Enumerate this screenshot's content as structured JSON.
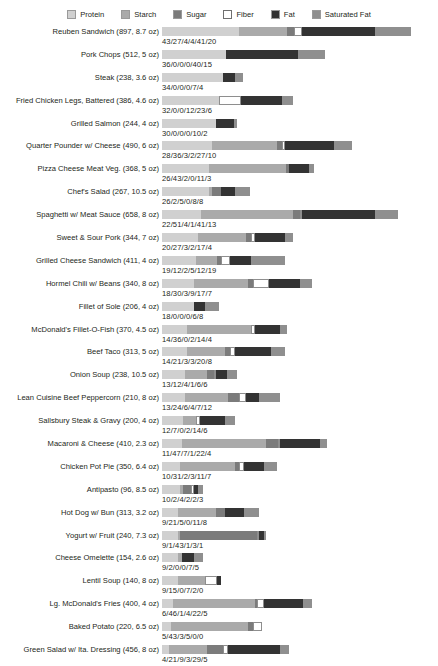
{
  "chart_data": {
    "type": "bar",
    "subtype": "stacked-horizontal",
    "title": "",
    "xlabel": "",
    "ylabel": "",
    "grid": false,
    "legend_position": "top-center",
    "value_label_format": "protein/starch/sugar/fiber/fat/saturated-fat (grams)",
    "px_per_unit": 1.79,
    "series": [
      {
        "name": "Protein",
        "color": "#d0d0d0"
      },
      {
        "name": "Starch",
        "color": "#aaaaaa"
      },
      {
        "name": "Sugar",
        "color": "#7b7b7b"
      },
      {
        "name": "Fiber",
        "color": "#ffffff"
      },
      {
        "name": "Fat",
        "color": "#333333"
      },
      {
        "name": "Saturated Fat",
        "color": "#8f8f8f"
      }
    ],
    "categories": [
      "Reuben Sandwich (897, 8.7 oz)",
      "Pork Chops (512, 5 oz)",
      "Steak (238, 3.6 oz)",
      "Fried Chicken Legs, Battered (386, 4.6 oz)",
      "Grilled Salmon (244, 4 oz)",
      "Quarter Pounder w/ Cheese (490, 6 oz)",
      "Pizza Cheese Meat Veg. (368, 5 oz)",
      "Chef's Salad (267, 10.5 oz)",
      "Spaghetti w/ Meat Sauce (658, 8 oz)",
      "Sweet & Sour Pork (344, 7 oz)",
      "Grilled Cheese Sandwich (411, 4 oz)",
      "Hormel Chili w/ Beans (340, 8 oz)",
      "Fillet of Sole (206, 4 oz)",
      "McDonald's Fillet-O-Fish (370, 4.5 oz)",
      "Beef Taco (313, 5 oz)",
      "Onion Soup (238, 10.5 oz)",
      "Lean Cuisine Beef Peppercorn (210, 8 oz)",
      "Sallsbury Steak & Gravy (200, 4 oz)",
      "Macaroni & Cheese (410, 2.3 oz)",
      "Chicken Pot Pie (350, 6.4 oz)",
      "Antipasto (96, 8.5 oz)",
      "Hot Dog w/ Bun (313, 3.2 oz)",
      "Yogurt w/ Fruit (240, 7.3 oz)",
      "Cheese Omelette (154, 2.6 oz)",
      "Lentil Soup (140, 8 oz)",
      "Lg. McDonald's Fries (400, 4 oz)",
      "Baked Potato (220, 6.5 oz)",
      "Green Salad w/ Ita. Dressing (456, 8 oz)"
    ],
    "rows": [
      {
        "label": "Reuben Sandwich (897, 8.7 oz)",
        "values": [
          43,
          27,
          4,
          4,
          41,
          20
        ],
        "value_label": "43/27/4/4/41/20"
      },
      {
        "label": "Pork Chops (512, 5 oz)",
        "values": [
          36,
          0,
          0,
          0,
          40,
          15
        ],
        "value_label": "36/0/0/0/40/15"
      },
      {
        "label": "Steak (238, 3.6 oz)",
        "values": [
          34,
          0,
          0,
          0,
          7,
          4
        ],
        "value_label": "34/0/0/0/7/4"
      },
      {
        "label": "Fried Chicken Legs, Battered (386, 4.6 oz)",
        "values": [
          32,
          0,
          0,
          12,
          23,
          6
        ],
        "value_label": "32/0/0/12/23/6"
      },
      {
        "label": "Grilled Salmon (244, 4 oz)",
        "values": [
          30,
          0,
          0,
          0,
          10,
          2
        ],
        "value_label": "30/0/0/0/10/2"
      },
      {
        "label": "Quarter Pounder w/ Cheese (490, 6 oz)",
        "values": [
          28,
          36,
          3,
          2,
          27,
          10
        ],
        "value_label": "28/36/3/2/27/10"
      },
      {
        "label": "Pizza Cheese Meat Veg. (368, 5 oz)",
        "values": [
          26,
          43,
          2,
          0,
          11,
          3
        ],
        "value_label": "26/43/2/0/11/3"
      },
      {
        "label": "Chef's Salad (267, 10.5 oz)",
        "values": [
          26,
          2,
          5,
          0,
          8,
          8
        ],
        "value_label": "26/2/5/0/8/8"
      },
      {
        "label": "Spaghetti w/ Meat Sauce (658, 8 oz)",
        "values": [
          22,
          51,
          4,
          1,
          41,
          13
        ],
        "value_label": "22/51/4/1/41/13"
      },
      {
        "label": "Sweet & Sour Pork (344, 7 oz)",
        "values": [
          20,
          27,
          3,
          2,
          17,
          4
        ],
        "value_label": "20/27/3/2/17/4"
      },
      {
        "label": "Grilled Cheese Sandwich (411, 4 oz)",
        "values": [
          19,
          12,
          2,
          5,
          12,
          19
        ],
        "value_label": "19/12/2/5/12/19"
      },
      {
        "label": "Hormel Chili w/ Beans (340, 8 oz)",
        "values": [
          18,
          30,
          3,
          9,
          17,
          7
        ],
        "value_label": "18/30/3/9/17/7"
      },
      {
        "label": "Fillet of Sole (206, 4 oz)",
        "values": [
          18,
          0,
          0,
          0,
          6,
          8
        ],
        "value_label": "18/0/0/0/6/8"
      },
      {
        "label": "McDonald's Fillet-O-Fish (370, 4.5 oz)",
        "values": [
          14,
          36,
          0,
          2,
          14,
          4
        ],
        "value_label": "14/36/0/2/14/4"
      },
      {
        "label": "Beef Taco (313, 5 oz)",
        "values": [
          14,
          21,
          3,
          3,
          20,
          8
        ],
        "value_label": "14/21/3/3/20/8"
      },
      {
        "label": "Onion Soup (238, 10.5 oz)",
        "values": [
          13,
          12,
          4,
          1,
          6,
          6
        ],
        "value_label": "13/12/4/1/6/6"
      },
      {
        "label": "Lean Cuisine Beef Peppercorn (210, 8 oz)",
        "values": [
          13,
          24,
          6,
          4,
          7,
          12
        ],
        "value_label": "13/24/6/4/7/12"
      },
      {
        "label": "Sallsbury Steak & Gravy (200, 4 oz)",
        "values": [
          12,
          7,
          0,
          2,
          14,
          6
        ],
        "value_label": "12/7/0/2/14/6"
      },
      {
        "label": "Macaroni & Cheese (410, 2.3 oz)",
        "values": [
          11,
          47,
          7,
          1,
          22,
          4
        ],
        "value_label": "11/47/7/1/22/4"
      },
      {
        "label": "Chicken Pot Pie (350, 6.4 oz)",
        "values": [
          10,
          31,
          2,
          3,
          11,
          7
        ],
        "value_label": "10/31/2/3/11/7"
      },
      {
        "label": "Antipasto (96, 8.5 oz)",
        "values": [
          10,
          2,
          4,
          2,
          2,
          3
        ],
        "value_label": "10/2/4/2/2/3"
      },
      {
        "label": "Hot Dog w/ Bun (313, 3.2 oz)",
        "values": [
          9,
          21,
          5,
          0,
          11,
          8
        ],
        "value_label": "9/21/5/0/11/8"
      },
      {
        "label": "Yogurt w/ Fruit (240, 7.3 oz)",
        "values": [
          9,
          1,
          43,
          1,
          3,
          1
        ],
        "value_label": "9/1/43/1/3/1"
      },
      {
        "label": "Cheese Omelette (154, 2.6 oz)",
        "values": [
          9,
          2,
          0,
          0,
          7,
          5
        ],
        "value_label": "9/2/0/0/7/5"
      },
      {
        "label": "Lentil Soup (140, 8 oz)",
        "values": [
          9,
          15,
          0,
          7,
          2,
          0
        ],
        "value_label": "9/15/0/7/2/0"
      },
      {
        "label": "Lg. McDonald's Fries (400, 4 oz)",
        "values": [
          6,
          46,
          1,
          4,
          22,
          5
        ],
        "value_label": "6/46/1/4/22/5"
      },
      {
        "label": "Baked Potato (220, 6.5 oz)",
        "values": [
          5,
          43,
          3,
          5,
          0,
          0
        ],
        "value_label": "5/43/3/5/0/0"
      },
      {
        "label": "Green Salad w/ Ita. Dressing (456, 8 oz)",
        "values": [
          4,
          21,
          9,
          3,
          29,
          5
        ],
        "value_label": "4/21/9/3/29/5"
      }
    ]
  },
  "legend": {
    "items": [
      {
        "label": "Protein",
        "color": "#d0d0d0"
      },
      {
        "label": "Starch",
        "color": "#aaaaaa"
      },
      {
        "label": "Sugar",
        "color": "#7b7b7b"
      },
      {
        "label": "Fiber",
        "color": "#ffffff"
      },
      {
        "label": "Fat",
        "color": "#333333"
      },
      {
        "label": "Saturated Fat",
        "color": "#8f8f8f"
      }
    ]
  }
}
